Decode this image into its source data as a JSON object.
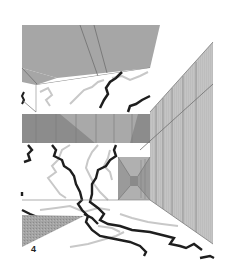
{
  "figure": {
    "label": "4",
    "colors": {
      "background": "#ffffff",
      "ceiling": "#a6a6a6",
      "ceiling_lines": "#6f6f6f",
      "wall_dark": "#8c8c8c",
      "wall_mid": "#a9a9a9",
      "wall_light": "#c2c2c2",
      "right_wall": "#c4c4c4",
      "right_wall_lines": "#7a7a7a",
      "corridor_end": "#9a9a9a",
      "crack_dark": "#1e1e1e",
      "crack_light": "#c8c8c8",
      "shadow_triangle": "#9e9e9e"
    }
  }
}
